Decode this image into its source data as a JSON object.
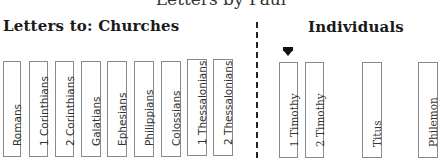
{
  "title": "Letters by Paul",
  "headings": {
    "churches": "Letters to:  Churches",
    "individuals": "Individuals"
  },
  "churches": [
    {
      "name": "Romans"
    },
    {
      "name": "1 Corinthians"
    },
    {
      "name": "2 Corinthians"
    },
    {
      "name": "Galatians"
    },
    {
      "name": "Ephesians"
    },
    {
      "name": "Philippians"
    },
    {
      "name": "Colossians"
    },
    {
      "name": "1 Thessalonians"
    },
    {
      "name": "2 Thessalonians"
    }
  ],
  "individuals": [
    {
      "name": "1 Timothy",
      "marked": true
    },
    {
      "name": "2 Timothy"
    },
    {
      "name": "Titus"
    },
    {
      "name": "Philemon"
    }
  ]
}
